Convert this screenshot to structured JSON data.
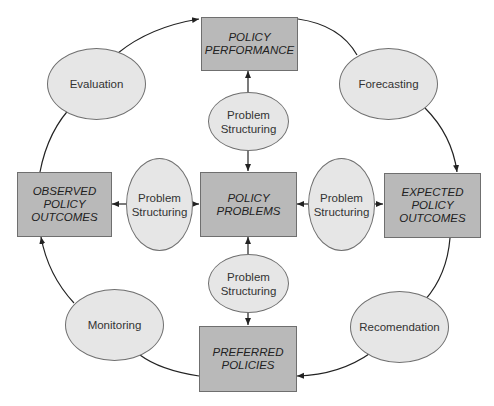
{
  "diagram": {
    "boxes": {
      "policy_performance": "POLICY\nPERFORMANCE",
      "observed_outcomes": "OBSERVED\nPOLICY\nOUTCOMES",
      "policy_problems": "POLICY\nPROBLEMS",
      "expected_outcomes": "EXPECTED\nPOLICY\nOUTCOMES",
      "preferred_policies": "PREFERRED\nPOLICIES"
    },
    "outer_ovals": {
      "evaluation": "Evaluation",
      "forecasting": "Forecasting",
      "monitoring": "Monitoring",
      "recommendation": "Recomendation"
    },
    "inner_ovals": {
      "top": "Problem\nStructuring",
      "left": "Problem\nStructuring",
      "right": "Problem\nStructuring",
      "bottom": "Problem\nStructuring"
    },
    "colors": {
      "box_fill": "#b9b9b9",
      "oval_fill": "#e6e6e6",
      "stroke": "#222222"
    }
  }
}
